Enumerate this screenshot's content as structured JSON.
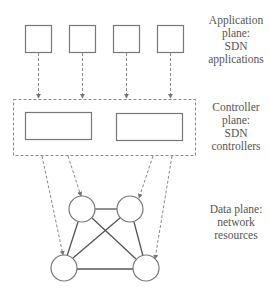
{
  "diagram": {
    "colors": {
      "stroke": "#777777",
      "dashed": "#8a8a8a",
      "text": "#555555",
      "fill": "#ffffff"
    },
    "planes": [
      {
        "id": "application",
        "label_lines": [
          "Application",
          "plane:",
          "SDN",
          "applications"
        ],
        "node_count": 4,
        "node_shape": "square"
      },
      {
        "id": "controller",
        "label_lines": [
          "Controller",
          "plane:",
          "SDN",
          "controllers"
        ],
        "node_count": 2,
        "node_shape": "rectangle",
        "container": "dashed-box"
      },
      {
        "id": "data",
        "label_lines": [
          "Data plane:",
          "network",
          "resources"
        ],
        "node_count": 4,
        "node_shape": "circle"
      }
    ],
    "edges": {
      "app_to_controller": [
        {
          "from": "app-1",
          "to": "controller-box",
          "style": "dashed-arrow"
        },
        {
          "from": "app-2",
          "to": "controller-box",
          "style": "dashed-arrow"
        },
        {
          "from": "app-3",
          "to": "controller-box",
          "style": "dashed-arrow"
        },
        {
          "from": "app-4",
          "to": "controller-box",
          "style": "dashed-arrow"
        }
      ],
      "controller_to_data": [
        {
          "from": "controller-box",
          "to": "node-bottom-left",
          "style": "dashed-arrow"
        },
        {
          "from": "controller-box",
          "to": "node-top-left",
          "style": "dashed-arrow"
        },
        {
          "from": "controller-box",
          "to": "node-top-right",
          "style": "dashed-arrow"
        },
        {
          "from": "controller-box",
          "to": "node-bottom-right",
          "style": "dashed-arrow"
        }
      ],
      "data_links": [
        {
          "from": "node-top-left",
          "to": "node-top-right"
        },
        {
          "from": "node-top-left",
          "to": "node-bottom-left"
        },
        {
          "from": "node-top-left",
          "to": "node-bottom-right"
        },
        {
          "from": "node-top-right",
          "to": "node-bottom-left"
        },
        {
          "from": "node-top-right",
          "to": "node-bottom-right"
        },
        {
          "from": "node-bottom-left",
          "to": "node-bottom-right"
        }
      ]
    }
  }
}
